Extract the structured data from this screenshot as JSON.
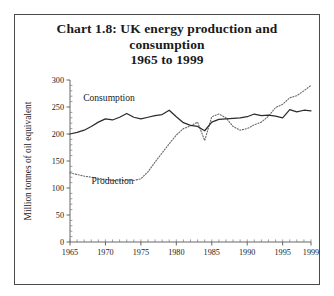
{
  "figure": {
    "title_lines": [
      "Chart 1.8: UK energy production and",
      "consumption",
      "1965 to 1999"
    ],
    "title_full": "Chart 1.8: UK energy production and consumption 1965 to 1999"
  },
  "chart_data": {
    "type": "line",
    "title": "Chart 1.8: UK energy production and consumption 1965 to 1999",
    "xlabel": "",
    "ylabel": "Million tonnes of oil equivalent",
    "xlim": [
      1965,
      1999
    ],
    "ylim": [
      0,
      300
    ],
    "yticks": [
      0,
      50,
      100,
      150,
      200,
      250,
      300
    ],
    "ytick_labels": [
      "0",
      "50",
      "100",
      "150",
      "200",
      "250",
      "300"
    ],
    "xticks": [
      1965,
      1970,
      1975,
      1980,
      1985,
      1990,
      1995,
      1999
    ],
    "xtick_labels": [
      "1965",
      "1970",
      "1975",
      "1980",
      "1985",
      "1990",
      "1995",
      "1999"
    ],
    "x_minor_step": 1,
    "grid": false,
    "legend": "inline-annotations",
    "annotations": [
      {
        "text": "Consumption",
        "x": 1970.5,
        "y": 262
      },
      {
        "text": "Production",
        "x": 1971.0,
        "y": 108
      }
    ],
    "x": [
      1965,
      1966,
      1967,
      1968,
      1969,
      1970,
      1971,
      1972,
      1973,
      1974,
      1975,
      1976,
      1977,
      1978,
      1979,
      1980,
      1981,
      1982,
      1983,
      1984,
      1985,
      1986,
      1987,
      1988,
      1989,
      1990,
      1991,
      1992,
      1993,
      1994,
      1995,
      1996,
      1997,
      1998,
      1999
    ],
    "series": [
      {
        "name": "Consumption",
        "style": "solid",
        "color": "#2b2b2b",
        "values": [
          200,
          203,
          207,
          214,
          222,
          228,
          226,
          231,
          238,
          231,
          228,
          231,
          234,
          236,
          244,
          232,
          221,
          216,
          214,
          206,
          222,
          227,
          228,
          229,
          230,
          232,
          237,
          234,
          235,
          233,
          230,
          245,
          241,
          244,
          243
        ]
      },
      {
        "name": "Production",
        "style": "dotted",
        "color": "#6b6b6b",
        "values": [
          128,
          125,
          122,
          120,
          118,
          116,
          114,
          113,
          115,
          114,
          117,
          130,
          148,
          165,
          182,
          198,
          210,
          215,
          222,
          188,
          232,
          237,
          230,
          214,
          207,
          210,
          217,
          222,
          233,
          249,
          255,
          267,
          271,
          280,
          290
        ]
      }
    ]
  }
}
